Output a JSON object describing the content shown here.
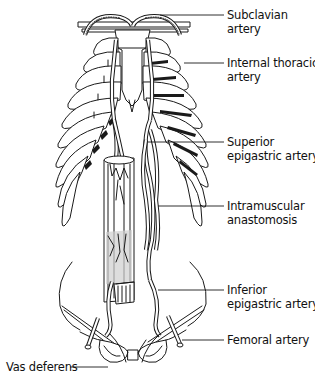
{
  "figure": {
    "type": "anatomical line drawing",
    "colors": {
      "ink": "#1a1a1a",
      "background": "#ffffff"
    }
  },
  "labels": [
    {
      "id": "subclavian",
      "lines": [
        "Subclavian",
        "artery"
      ]
    },
    {
      "id": "internal_thoracic",
      "lines": [
        "Internal thoracic",
        "artery"
      ]
    },
    {
      "id": "superior_epigastric",
      "lines": [
        "Superior",
        "epigastric artery"
      ]
    },
    {
      "id": "intramuscular",
      "lines": [
        "Intramuscular",
        "anastomosis"
      ]
    },
    {
      "id": "inferior_epigastric",
      "lines": [
        "Inferior",
        "epigastric artery"
      ]
    },
    {
      "id": "femoral",
      "lines": [
        "Femoral artery"
      ]
    },
    {
      "id": "vas_deferens",
      "lines": [
        "Vas deferens"
      ]
    }
  ]
}
